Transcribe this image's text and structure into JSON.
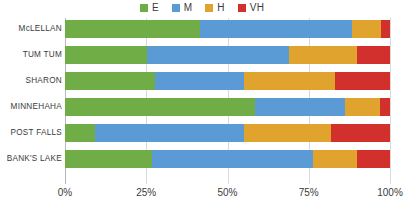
{
  "chart_data": {
    "type": "bar",
    "orientation": "horizontal",
    "stacked": true,
    "normalized_percent": true,
    "title": "",
    "subtitle": "",
    "xlabel": "",
    "ylabel": "",
    "xlim": [
      0,
      100
    ],
    "grid": true,
    "legend_position": "top-center",
    "categories": [
      "McLELLAN",
      "TUM TUM",
      "SHARON",
      "MINNEHAHA",
      "POST FALLS",
      "BANK'S LAKE"
    ],
    "tick_labels": [
      "0%",
      "25%",
      "50%",
      "75%",
      "100%"
    ],
    "tick_values": [
      0,
      25,
      50,
      75,
      100
    ],
    "series": [
      {
        "name": "E",
        "color": "#70AD47",
        "values": [
          41.5,
          25.2,
          27.7,
          58.5,
          9.2,
          26.8
        ]
      },
      {
        "name": "M",
        "color": "#5B9BD5",
        "values": [
          46.8,
          43.8,
          27.4,
          27.7,
          45.8,
          49.5
        ]
      },
      {
        "name": "H",
        "color": "#E0A32E",
        "values": [
          8.9,
          21.0,
          27.9,
          10.8,
          27.0,
          13.7
        ]
      },
      {
        "name": "VH",
        "color": "#D2302C",
        "values": [
          2.8,
          10.0,
          17.0,
          3.0,
          18.0,
          10.0
        ]
      }
    ]
  },
  "legend": {
    "items": [
      {
        "label": "E",
        "color": "#70AD47"
      },
      {
        "label": "M",
        "color": "#5B9BD5"
      },
      {
        "label": "H",
        "color": "#E0A32E"
      },
      {
        "label": "VH",
        "color": "#D2302C"
      }
    ]
  }
}
